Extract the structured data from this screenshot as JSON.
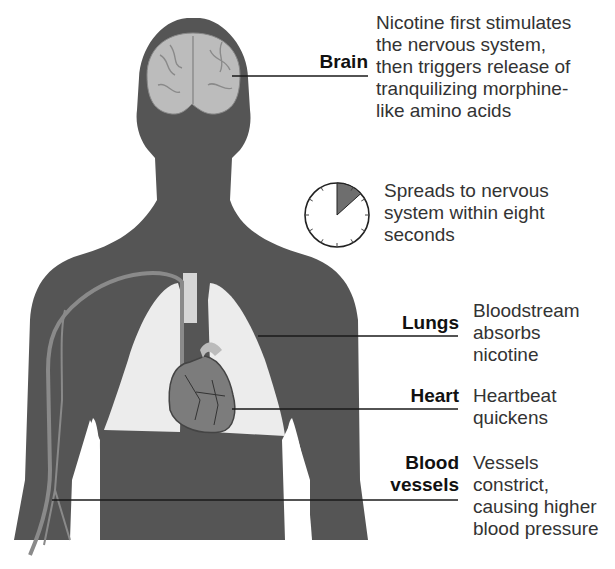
{
  "figure": {
    "colors": {
      "silhouette": "#555555",
      "organ_light": "#e9e9e9",
      "brain": "#bdbdbd",
      "heart": "#7a7a7a",
      "vessel": "#8a8a8a",
      "clock_wedge": "#6e6e6e",
      "text": "#333333",
      "label": "#111111"
    },
    "annotations": [
      {
        "organ": "Brain",
        "description_lines": [
          "Nicotine first stimulates",
          "the nervous system,",
          "then triggers release of",
          "tranquilizing morphine-",
          "like amino acids"
        ]
      },
      {
        "organ": "Lungs",
        "description_lines": [
          "Bloodstream",
          "absorbs",
          "nicotine"
        ]
      },
      {
        "organ": "Heart",
        "description_lines": [
          "Heartbeat",
          "quickens"
        ]
      },
      {
        "organ_lines": [
          "Blood",
          "vessels"
        ],
        "description_lines": [
          "Vessels",
          "constrict,",
          "causing higher",
          "blood pressure"
        ]
      }
    ],
    "timer": {
      "icon": "clock-icon",
      "seconds": 8,
      "description_lines": [
        "Spreads to nervous",
        "system within eight",
        "seconds"
      ]
    }
  }
}
